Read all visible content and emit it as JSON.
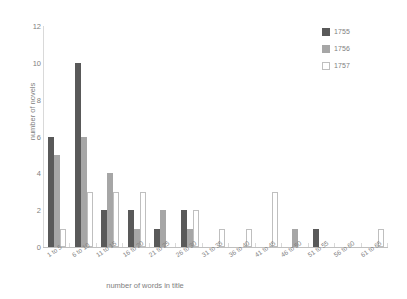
{
  "chart_data": {
    "type": "bar",
    "title": "",
    "xlabel": "number of words in title",
    "ylabel": "number of novels",
    "categories": [
      "1 to 5",
      "6 to 10",
      "11 to 15",
      "16 to 20",
      "21 to 25",
      "26 to 30",
      "31 to 35",
      "36 to 40",
      "41 to 45",
      "46 to 50",
      "51 to 55",
      "56 to 60",
      "61 to 65"
    ],
    "series": [
      {
        "name": "1755",
        "color": "#595959",
        "values": [
          6,
          10,
          2,
          2,
          1,
          2,
          0,
          0,
          0,
          0,
          1,
          0,
          0
        ]
      },
      {
        "name": "1756",
        "color": "#a6a6a6",
        "values": [
          5,
          6,
          4,
          1,
          2,
          1,
          0,
          0,
          0,
          1,
          0,
          0,
          0
        ]
      },
      {
        "name": "1757",
        "color": "#ffffff",
        "values": [
          1,
          3,
          3,
          3,
          0,
          2,
          1,
          1,
          3,
          0,
          0,
          0,
          1
        ]
      }
    ],
    "ylim": [
      0,
      12
    ],
    "yticks": [
      "0",
      "2",
      "4",
      "6",
      "8",
      "10",
      "12"
    ],
    "grid": false,
    "legend_position": "top-right"
  }
}
